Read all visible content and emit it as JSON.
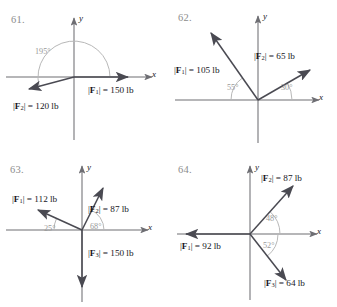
{
  "colors": {
    "background": "#ffffff",
    "axis": "#6e6e73",
    "vector": "#4a4a52",
    "angle_arc": "#b0b0b0",
    "angle_text": "#9a9a9a",
    "label_text": "#17171c",
    "problem_number": "#8d8d8d"
  },
  "panels": [
    {
      "number": "61.",
      "axis_x_label": "x",
      "axis_y_label": "y",
      "angles": [
        {
          "text": "195°",
          "value": 195,
          "from_axis": "positive-x",
          "direction": "counterclockwise"
        }
      ],
      "vectors": [
        {
          "name": "F1",
          "label_html": "|<b>F</b><sub>1</sub>| = 150 lb",
          "magnitude": 150,
          "unit": "lb",
          "direction_deg": 0
        },
        {
          "name": "F2",
          "label_html": "|<b>F</b><sub>2</sub>| = 120 lb",
          "magnitude": 120,
          "unit": "lb",
          "direction_deg": 195
        }
      ]
    },
    {
      "number": "62.",
      "axis_x_label": "x",
      "axis_y_label": "y",
      "angles": [
        {
          "text": "55°",
          "value": 55,
          "from_axis": "negative-x",
          "direction": "clockwise"
        },
        {
          "text": "30°",
          "value": 30,
          "from_axis": "positive-x",
          "direction": "counterclockwise"
        }
      ],
      "vectors": [
        {
          "name": "F1",
          "label_html": "|<b>F</b><sub>1</sub>| = 105 lb",
          "magnitude": 105,
          "unit": "lb",
          "direction_deg": 125
        },
        {
          "name": "F2",
          "label_html": "|<b>F</b><sub>2</sub>| = 65 lb",
          "magnitude": 65,
          "unit": "lb",
          "direction_deg": 30
        }
      ]
    },
    {
      "number": "63.",
      "axis_x_label": "x",
      "axis_y_label": "y",
      "angles": [
        {
          "text": "25°",
          "value": 25,
          "from_axis": "negative-x",
          "direction": "clockwise"
        },
        {
          "text": "68°",
          "value": 68,
          "from_axis": "positive-x",
          "direction": "counterclockwise"
        }
      ],
      "vectors": [
        {
          "name": "F1",
          "label_html": "|<b>F</b><sub>1</sub>| = 112 lb",
          "magnitude": 112,
          "unit": "lb",
          "direction_deg": 155
        },
        {
          "name": "F2",
          "label_html": "|<b>F</b><sub>2</sub>| = 87 lb",
          "magnitude": 87,
          "unit": "lb",
          "direction_deg": 68
        },
        {
          "name": "F3",
          "label_html": "|<b>F</b><sub>3</sub>| = 150 lb",
          "magnitude": 150,
          "unit": "lb",
          "direction_deg": 270
        }
      ]
    },
    {
      "number": "64.",
      "axis_x_label": "x",
      "axis_y_label": "y",
      "angles": [
        {
          "text": "48°",
          "value": 48,
          "from_axis": "positive-x",
          "direction": "counterclockwise"
        },
        {
          "text": "52°",
          "value": 52,
          "from_axis": "positive-x",
          "direction": "clockwise"
        }
      ],
      "vectors": [
        {
          "name": "F1",
          "label_html": "|<b>F</b><sub>1</sub>| = 92 lb",
          "magnitude": 92,
          "unit": "lb",
          "direction_deg": 180
        },
        {
          "name": "F2",
          "label_html": "|<b>F</b><sub>2</sub>| = 87 lb",
          "magnitude": 87,
          "unit": "lb",
          "direction_deg": 48
        },
        {
          "name": "F3",
          "label_html": "|<b>F</b><sub>3</sub>| = 64 lb",
          "magnitude": 64,
          "unit": "lb",
          "direction_deg": -52
        }
      ]
    }
  ]
}
